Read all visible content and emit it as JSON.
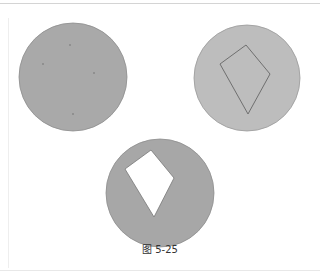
{
  "figure": {
    "caption": "图 5-25",
    "colors": {
      "circle_left": "#a9a9a9",
      "circle_right": "#bdbdbd",
      "circle_bottom": "#a7a7a7",
      "outline": "#777777",
      "hole": "#ffffff"
    },
    "panels": [
      {
        "name": "plain-circle",
        "shape": "circle"
      },
      {
        "name": "circle-with-kite-outline",
        "shape": "circle + kite outline"
      },
      {
        "name": "circle-with-kite-hole",
        "shape": "circle with kite-shaped cutout"
      }
    ]
  }
}
